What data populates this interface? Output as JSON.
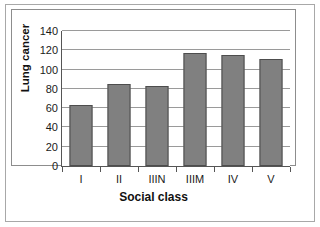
{
  "chart_data": {
    "type": "bar",
    "title": "",
    "xlabel": "Social class",
    "ylabel": "Lung cancer",
    "categories": [
      "I",
      "II",
      "IIIN",
      "IIIM",
      "IV",
      "V"
    ],
    "values": [
      63,
      85,
      83,
      117,
      115,
      111
    ],
    "ylim": [
      0,
      140
    ],
    "yticks": [
      0,
      20,
      40,
      60,
      80,
      100,
      120,
      140
    ],
    "ytick_labels": [
      "0",
      "20",
      "40",
      "60",
      "80",
      "100",
      "120",
      "140"
    ],
    "grid": true,
    "legend": "none",
    "series": [
      {
        "name": "Lung cancer",
        "values": [
          63,
          85,
          83,
          117,
          115,
          111
        ],
        "color": "#808080"
      }
    ]
  },
  "style": {
    "bar_fill": "#808080",
    "bar_edge": "#4d4d4d",
    "gridline_color": "#9a9a9a",
    "axis_color": "#555555",
    "frame_color": "#8d8d8d",
    "page_border_color": "#a8a8a8",
    "background": "#ffffff"
  }
}
